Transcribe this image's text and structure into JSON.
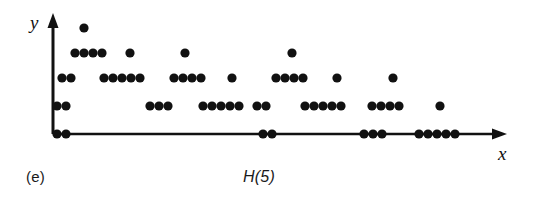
{
  "figure": {
    "caption": "(e)",
    "title": "H(5)",
    "x_axis_label": "x",
    "y_axis_label": "y",
    "ink_color": "#111111",
    "background_color": "#ffffff"
  },
  "chart_data": {
    "type": "scatter",
    "title": "H(5)",
    "subtitle": "(e)",
    "xlabel": "x",
    "ylabel": "y",
    "grid": false,
    "legend": null,
    "axes": {
      "x_origin_px": 53,
      "x_end_px": 503,
      "y_baseline_px": 134,
      "y_top_px": 16,
      "level_y_px": [
        134,
        106,
        78,
        53,
        28
      ],
      "levels": [
        0,
        1,
        2,
        3,
        4
      ],
      "dot_radius_px": 4.6,
      "x_step_px": 9.3
    },
    "note": "Discrete dot-diagram: each dot is one observation at an integer height level. Points listed as pixel x centers paired with height level.",
    "points": [
      {
        "x": 57,
        "level": 0
      },
      {
        "x": 66,
        "level": 0
      },
      {
        "x": 57,
        "level": 1
      },
      {
        "x": 66,
        "level": 1
      },
      {
        "x": 62,
        "level": 2
      },
      {
        "x": 71,
        "level": 2
      },
      {
        "x": 75,
        "level": 3
      },
      {
        "x": 84,
        "level": 3
      },
      {
        "x": 93,
        "level": 3
      },
      {
        "x": 102,
        "level": 3
      },
      {
        "x": 84,
        "level": 4
      },
      {
        "x": 104,
        "level": 2
      },
      {
        "x": 113,
        "level": 2
      },
      {
        "x": 122,
        "level": 2
      },
      {
        "x": 131,
        "level": 2
      },
      {
        "x": 140,
        "level": 2
      },
      {
        "x": 130,
        "level": 3
      },
      {
        "x": 150,
        "level": 1
      },
      {
        "x": 159,
        "level": 1
      },
      {
        "x": 168,
        "level": 1
      },
      {
        "x": 174,
        "level": 2
      },
      {
        "x": 183,
        "level": 2
      },
      {
        "x": 192,
        "level": 2
      },
      {
        "x": 201,
        "level": 2
      },
      {
        "x": 185,
        "level": 3
      },
      {
        "x": 203,
        "level": 1
      },
      {
        "x": 212,
        "level": 1
      },
      {
        "x": 221,
        "level": 1
      },
      {
        "x": 230,
        "level": 1
      },
      {
        "x": 239,
        "level": 1
      },
      {
        "x": 232,
        "level": 2
      },
      {
        "x": 257,
        "level": 1
      },
      {
        "x": 266,
        "level": 1
      },
      {
        "x": 263,
        "level": 0
      },
      {
        "x": 272,
        "level": 0
      },
      {
        "x": 276,
        "level": 2
      },
      {
        "x": 285,
        "level": 2
      },
      {
        "x": 294,
        "level": 2
      },
      {
        "x": 303,
        "level": 2
      },
      {
        "x": 292,
        "level": 3
      },
      {
        "x": 305,
        "level": 1
      },
      {
        "x": 314,
        "level": 1
      },
      {
        "x": 323,
        "level": 1
      },
      {
        "x": 332,
        "level": 1
      },
      {
        "x": 341,
        "level": 1
      },
      {
        "x": 337,
        "level": 2
      },
      {
        "x": 364,
        "level": 0
      },
      {
        "x": 373,
        "level": 0
      },
      {
        "x": 382,
        "level": 0
      },
      {
        "x": 372,
        "level": 1
      },
      {
        "x": 381,
        "level": 1
      },
      {
        "x": 390,
        "level": 1
      },
      {
        "x": 399,
        "level": 1
      },
      {
        "x": 393,
        "level": 2
      },
      {
        "x": 419,
        "level": 0
      },
      {
        "x": 428,
        "level": 0
      },
      {
        "x": 437,
        "level": 0
      },
      {
        "x": 446,
        "level": 0
      },
      {
        "x": 455,
        "level": 0
      },
      {
        "x": 440,
        "level": 1
      }
    ]
  }
}
